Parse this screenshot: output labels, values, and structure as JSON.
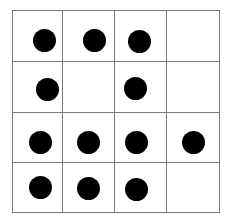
{
  "figure": {
    "type": "ten-frame-style grid",
    "rows": 4,
    "cols": 4,
    "line_color": "#7a7a7a",
    "dot_color": "#000000",
    "total_dots": 12,
    "cells": [
      [
        {
          "dot": true,
          "dx": 31,
          "dy": 29
        },
        {
          "dot": true,
          "dx": 31,
          "dy": 29
        },
        {
          "dot": true,
          "dx": 24,
          "dy": 30
        },
        {
          "dot": false
        }
      ],
      [
        {
          "dot": true,
          "dx": 34,
          "dy": 27
        },
        {
          "dot": false
        },
        {
          "dot": true,
          "dx": 20,
          "dy": 26
        },
        {
          "dot": false
        }
      ],
      [
        {
          "dot": true,
          "dx": 27,
          "dy": 29
        },
        {
          "dot": true,
          "dx": 25,
          "dy": 29
        },
        {
          "dot": true,
          "dx": 21,
          "dy": 29
        },
        {
          "dot": true,
          "dx": 26,
          "dy": 29
        }
      ],
      [
        {
          "dot": true,
          "dx": 27,
          "dy": 24
        },
        {
          "dot": true,
          "dx": 25,
          "dy": 25
        },
        {
          "dot": true,
          "dx": 21,
          "dy": 26
        },
        {
          "dot": false
        }
      ]
    ]
  }
}
